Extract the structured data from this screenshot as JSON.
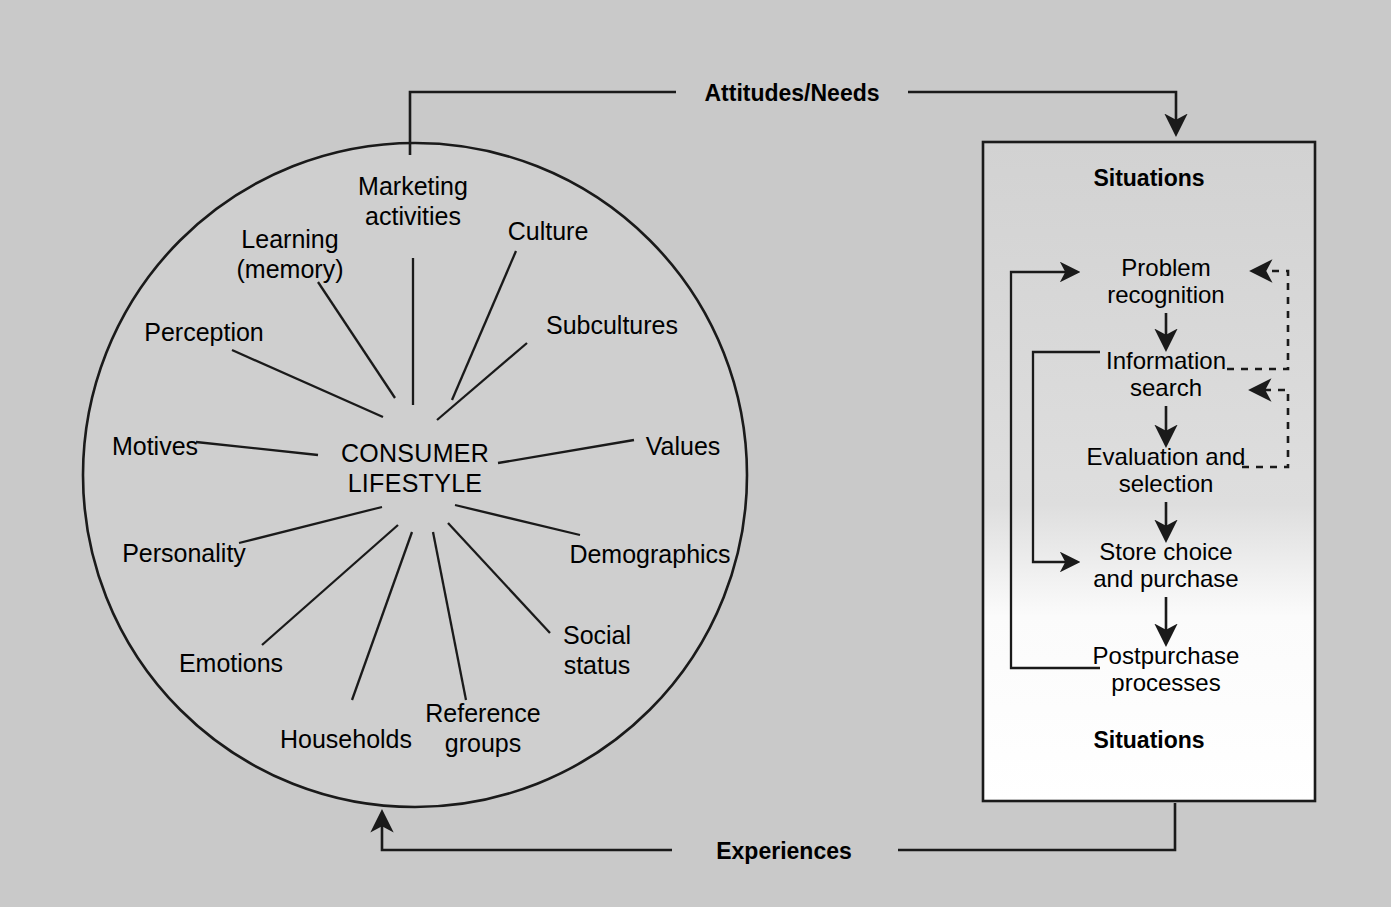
{
  "diagram": {
    "background_color": "#c9c9c9",
    "line_color": "#1a1a1a",
    "panel_fill_top": "#d0d0d0",
    "panel_fill_bottom": "#ffffff"
  },
  "circle": {
    "center_label_line1": "CONSUMER",
    "center_label_line2": "LIFESTYLE",
    "spokes": [
      {
        "id": "marketing-activities",
        "label_line1": "Marketing",
        "label_line2": "activities"
      },
      {
        "id": "culture",
        "label_line1": "Culture",
        "label_line2": ""
      },
      {
        "id": "subcultures",
        "label_line1": "Subcultures",
        "label_line2": ""
      },
      {
        "id": "values",
        "label_line1": "Values",
        "label_line2": ""
      },
      {
        "id": "demographics",
        "label_line1": "Demographics",
        "label_line2": ""
      },
      {
        "id": "social-status",
        "label_line1": "Social",
        "label_line2": "status"
      },
      {
        "id": "reference-groups",
        "label_line1": "Reference",
        "label_line2": "groups"
      },
      {
        "id": "households",
        "label_line1": "Households",
        "label_line2": ""
      },
      {
        "id": "emotions",
        "label_line1": "Emotions",
        "label_line2": ""
      },
      {
        "id": "personality",
        "label_line1": "Personality",
        "label_line2": ""
      },
      {
        "id": "motives",
        "label_line1": "Motives",
        "label_line2": ""
      },
      {
        "id": "perception",
        "label_line1": "Perception",
        "label_line2": ""
      },
      {
        "id": "learning-memory",
        "label_line1": "Learning",
        "label_line2": "(memory)"
      }
    ]
  },
  "connectors": {
    "top_label": "Attitudes/Needs",
    "bottom_label": "Experiences"
  },
  "panel": {
    "header_label": "Situations",
    "footer_label": "Situations",
    "steps": [
      {
        "id": "problem-recognition",
        "line1": "Problem",
        "line2": "recognition"
      },
      {
        "id": "information-search",
        "line1": "Information",
        "line2": "search"
      },
      {
        "id": "evaluation-and-selection",
        "line1": "Evaluation and",
        "line2": "selection"
      },
      {
        "id": "store-choice-and-purchase",
        "line1": "Store choice",
        "line2": "and purchase"
      },
      {
        "id": "postpurchase-processes",
        "line1": "Postpurchase",
        "line2": "processes"
      }
    ]
  }
}
